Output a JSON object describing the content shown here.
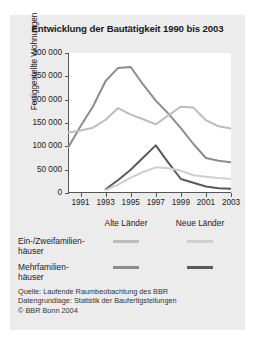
{
  "chart_data": {
    "type": "line",
    "title": "Entwicklung der Bautätigkeit 1990 bis 2003",
    "xlabel": "",
    "ylabel": "Fertiggestellte Wohnungen",
    "x": [
      1990,
      1991,
      1992,
      1993,
      1994,
      1995,
      1996,
      1997,
      1998,
      1999,
      2000,
      2001,
      2002,
      2003
    ],
    "xlim": [
      1990,
      2003
    ],
    "ylim": [
      0,
      300000
    ],
    "yticks": [
      0,
      50000,
      100000,
      150000,
      200000,
      250000,
      300000
    ],
    "ytick_labels": [
      "0",
      "50 000",
      "100 000",
      "150 000",
      "200 000",
      "250 000",
      "300 000"
    ],
    "xticks": [
      1991,
      1993,
      1995,
      1997,
      1999,
      2001,
      2003
    ],
    "xtick_labels": [
      "1991",
      "1993",
      "1995",
      "1997",
      "1999",
      "2001",
      "2003"
    ],
    "grid": false,
    "legend_position": "below",
    "series": [
      {
        "name": "Alte Länder – Mehrfamilienhäuser",
        "region": "Alte Länder",
        "category": "Mehrfamilienhäuser",
        "color": "#8c8c8c",
        "x": [
          1990,
          1991,
          1992,
          1993,
          1994,
          1995,
          1996,
          1997,
          1998,
          1999,
          2000,
          2001,
          2002,
          2003
        ],
        "values": [
          97000,
          143000,
          186000,
          240000,
          268000,
          270000,
          232000,
          198000,
          170000,
          139000,
          105000,
          75000,
          69000,
          66000
        ]
      },
      {
        "name": "Alte Länder – Ein-/Zweifamilienhäuser",
        "region": "Alte Länder",
        "category": "Ein-/Zweifamilienhäuser",
        "color": "#bdbdbd",
        "x": [
          1990,
          1991,
          1992,
          1993,
          1994,
          1995,
          1996,
          1997,
          1998,
          1999,
          2000,
          2001,
          2002,
          2003
        ],
        "values": [
          129000,
          134000,
          140000,
          157000,
          182000,
          168000,
          158000,
          147000,
          166000,
          185000,
          183000,
          156000,
          143000,
          138000
        ]
      },
      {
        "name": "Neue Länder – Mehrfamilienhäuser",
        "region": "Neue Länder",
        "category": "Mehrfamilienhäuser",
        "color": "#595959",
        "x": [
          1993,
          1994,
          1995,
          1996,
          1997,
          1998,
          1999,
          2000,
          2001,
          2002,
          2003
        ],
        "values": [
          8000,
          28000,
          50000,
          76000,
          102000,
          65000,
          30000,
          22000,
          14000,
          10000,
          9000
        ]
      },
      {
        "name": "Neue Länder – Ein-/Zweifamilienhäuser",
        "region": "Neue Länder",
        "category": "Ein-/Zweifamilienhäuser",
        "color": "#cfcfcf",
        "x": [
          1993,
          1994,
          1995,
          1996,
          1997,
          1998,
          1999,
          2000,
          2001,
          2002,
          2003
        ],
        "values": [
          6000,
          18000,
          33000,
          45000,
          55000,
          53000,
          48000,
          38000,
          35000,
          32000,
          30000
        ]
      }
    ]
  },
  "legend": {
    "columns": [
      "Alte Länder",
      "Neue Länder"
    ],
    "rows": [
      {
        "line1": "Ein-/Zweifamilien-",
        "line2": "häuser",
        "colors": [
          "#bdbdbd",
          "#cfcfcf"
        ]
      },
      {
        "line1": "Mehrfamilien-",
        "line2": "häuser",
        "colors": [
          "#8c8c8c",
          "#595959"
        ]
      }
    ]
  },
  "source_note": {
    "line1": "Quelle: Laufende Raumbeobachtung des BBR",
    "line2": "Datengrundlage: Statistik der Baufertigstellungen",
    "line3": "© BBR Bonn 2004"
  }
}
